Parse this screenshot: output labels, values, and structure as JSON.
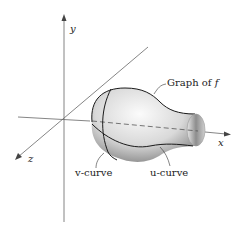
{
  "diagram": {
    "axes": {
      "x_label": "x",
      "y_label": "y",
      "z_label": "z"
    },
    "labels": {
      "graph": "Graph of ",
      "graph_f": "f",
      "v_curve": "v-curve",
      "u_curve": "u-curve"
    },
    "colors": {
      "axis": "#555555",
      "surface_light": "#f2f2f2",
      "surface_dark": "#8a8a8a",
      "curve": "#1a1a1a"
    }
  }
}
